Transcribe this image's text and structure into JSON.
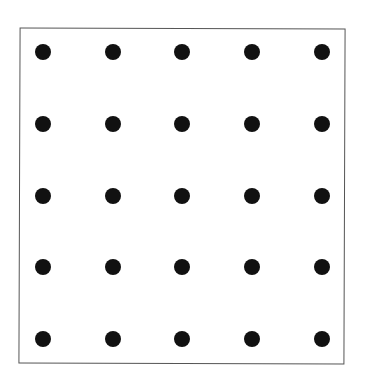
{
  "diagram": {
    "type": "dot-grid",
    "rows": 5,
    "columns": 5,
    "dot_color": "#111111",
    "frame_color": "#555555",
    "column_centers_px": [
      43,
      113,
      182,
      252,
      322
    ],
    "row_centers_px": [
      52,
      124,
      196,
      267,
      339
    ],
    "dot_diameter_px": 16
  }
}
